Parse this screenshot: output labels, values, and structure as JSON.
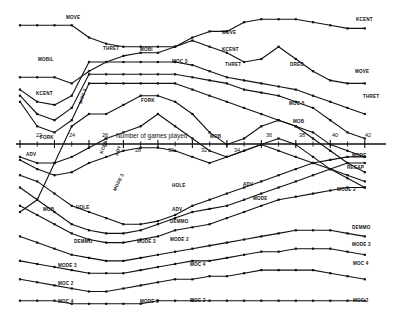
{
  "figure": {
    "kind": "scanned-multiline-chart",
    "background": "#ffffff",
    "ink": "#111111",
    "axis_title": "Number of games played"
  },
  "chart_data": {
    "type": "line",
    "title": "",
    "subtitle": "",
    "xlabel": "Number of games played",
    "ylabel": "",
    "grid": false,
    "legend": "inline-labels",
    "axis_position": "middle",
    "xlim": [
      21,
      43
    ],
    "ylim": [
      0,
      100
    ],
    "x_ticks": [
      22,
      24,
      26,
      28,
      30,
      32,
      34,
      36,
      38,
      40,
      42
    ],
    "x_tick_labels": [
      "22",
      "24",
      "26",
      "28",
      "30",
      "32",
      "34",
      "36",
      "38",
      "40",
      "42"
    ],
    "x_minor_ticks": [
      23,
      25,
      27,
      29,
      31,
      33,
      35,
      37,
      39,
      41
    ],
    "tick_label_alternating": true,
    "marker": "square",
    "series": [
      {
        "name": "MOVE",
        "label_left": "MOVE",
        "label_right": "KCENT",
        "x": [
          22,
          23,
          24,
          25,
          26,
          27,
          28,
          29,
          30,
          31,
          32,
          33,
          34,
          35,
          36,
          37,
          38,
          39,
          40,
          41,
          42
        ],
        "y": [
          95,
          95,
          95,
          95,
          91,
          89,
          88,
          88,
          88,
          88,
          91,
          93,
          93,
          96,
          97,
          97,
          97,
          96,
          95,
          94,
          94
        ]
      },
      {
        "name": "MOBIL",
        "label_left": "MOBIL",
        "label_right": "MOVE",
        "x": [
          22,
          23,
          24,
          25,
          26,
          27,
          28,
          29,
          30,
          31,
          32,
          33,
          34,
          35,
          36,
          37,
          38,
          39,
          40,
          41,
          42
        ],
        "y": [
          78,
          78,
          78,
          76,
          80,
          83,
          85,
          86,
          86,
          88,
          90,
          88,
          86,
          83,
          84,
          88,
          84,
          80,
          77,
          76,
          76
        ]
      },
      {
        "name": "KCENT",
        "label_left": "KCENT",
        "label_right": "THRET",
        "x": [
          22,
          23,
          24,
          25,
          26,
          27,
          28,
          29,
          30,
          31,
          32,
          33,
          34,
          35,
          36,
          37,
          38,
          39,
          40,
          41,
          42
        ],
        "y": [
          74,
          70,
          69,
          72,
          83,
          83,
          83,
          83,
          83,
          83,
          82,
          80,
          78,
          77,
          76,
          75,
          74,
          72,
          70,
          68,
          66
        ]
      },
      {
        "name": "THRET",
        "label_left": "",
        "label_right": "",
        "x": [
          22,
          23,
          24,
          25,
          26,
          27,
          28,
          29,
          30,
          31,
          32,
          33,
          34,
          35,
          36,
          37,
          38,
          39,
          40,
          41,
          42
        ],
        "y": [
          72,
          66,
          64,
          68,
          79,
          79,
          79,
          79,
          79,
          79,
          78,
          77,
          76,
          74,
          73,
          72,
          70,
          68,
          64,
          60,
          58
        ]
      },
      {
        "name": "MOBI",
        "label_left": "",
        "label_right": "",
        "x": [
          22,
          23,
          24,
          25,
          26,
          27,
          28,
          29,
          30,
          31,
          32,
          33,
          34,
          35,
          36,
          37,
          38,
          39,
          40,
          41,
          42
        ],
        "y": [
          70,
          62,
          60,
          64,
          76,
          76,
          76,
          76,
          76,
          76,
          74,
          72,
          70,
          68,
          66,
          64,
          62,
          60,
          56,
          54,
          52
        ]
      },
      {
        "name": "MOC 3",
        "label_left": "MOC 3",
        "label_right": "MOC 5",
        "x": [
          22,
          23,
          24,
          25,
          26,
          27,
          28,
          29,
          30,
          31,
          32,
          33,
          34,
          35,
          36,
          37,
          38,
          39,
          40,
          41,
          42
        ],
        "y": [
          34,
          38,
          50,
          62,
          66,
          66,
          69,
          72,
          72,
          70,
          66,
          60,
          56,
          58,
          62,
          64,
          62,
          58,
          54,
          50,
          47
        ]
      },
      {
        "name": "FORK",
        "label_left": "FORK",
        "label_right": "MOC 3",
        "x": [
          22,
          23,
          24,
          25,
          26,
          27,
          28,
          29,
          30,
          31,
          32,
          33,
          34,
          35,
          36,
          37,
          38,
          39,
          40,
          41,
          42
        ],
        "y": [
          52,
          50,
          50,
          52,
          55,
          58,
          60,
          62,
          66,
          62,
          58,
          54,
          52,
          54,
          56,
          54,
          52,
          50,
          48,
          46,
          44
        ]
      },
      {
        "name": "MOB",
        "label_left": "FORK",
        "label_right": "MOB",
        "x": [
          22,
          23,
          24,
          25,
          26,
          27,
          28,
          29,
          30,
          31,
          32,
          33,
          34,
          35,
          36,
          37,
          38,
          39,
          40,
          41,
          42
        ],
        "y": [
          51,
          48,
          46,
          47,
          50,
          52,
          54,
          55,
          55,
          54,
          52,
          50,
          52,
          54,
          56,
          58,
          56,
          52,
          48,
          45,
          42
        ]
      },
      {
        "name": "ADV",
        "label_left": "ADV",
        "label_right": "MODE",
        "x": [
          22,
          23,
          24,
          25,
          26,
          27,
          28,
          29,
          30,
          31,
          32,
          33,
          34,
          35,
          36,
          37,
          38,
          39,
          40,
          41,
          42
        ],
        "y": [
          46,
          44,
          40,
          36,
          34,
          32,
          30,
          30,
          31,
          33,
          36,
          38,
          40,
          42,
          44,
          46,
          48,
          50,
          51,
          52,
          52
        ]
      },
      {
        "name": "HOLE",
        "label_left": "HOLE",
        "label_right": "RECAP",
        "x": [
          22,
          23,
          24,
          25,
          26,
          27,
          28,
          29,
          30,
          31,
          32,
          33,
          34,
          35,
          36,
          37,
          38,
          39,
          40,
          41,
          42
        ],
        "y": [
          42,
          38,
          34,
          30,
          28,
          27,
          27,
          28,
          30,
          32,
          34,
          35,
          36,
          38,
          40,
          42,
          44,
          46,
          48,
          50,
          50
        ]
      },
      {
        "name": "DEMMO",
        "label_left": "DEMMO",
        "label_right": "MODE 2",
        "x": [
          22,
          23,
          24,
          25,
          26,
          27,
          28,
          29,
          30,
          31,
          32,
          33,
          34,
          35,
          36,
          37,
          38,
          39,
          40,
          41,
          42
        ],
        "y": [
          36,
          33,
          30,
          27,
          25,
          24,
          24,
          25,
          26,
          28,
          29,
          30,
          32,
          34,
          36,
          38,
          39,
          40,
          41,
          42,
          42
        ]
      },
      {
        "name": "MODE 3",
        "label_left": "MODE 3",
        "label_right": "DEMMO",
        "x": [
          22,
          23,
          24,
          25,
          26,
          27,
          28,
          29,
          30,
          31,
          32,
          33,
          34,
          35,
          36,
          37,
          38,
          39,
          40,
          41,
          42
        ],
        "y": [
          26,
          24,
          22,
          20,
          19,
          18,
          18,
          19,
          20,
          21,
          22,
          23,
          24,
          25,
          26,
          27,
          28,
          28,
          28,
          27,
          26
        ]
      },
      {
        "name": "MOC 2",
        "label_left": "MOC 2",
        "label_right": "MODE 3",
        "x": [
          22,
          23,
          24,
          25,
          26,
          27,
          28,
          29,
          30,
          31,
          32,
          33,
          34,
          35,
          36,
          37,
          38,
          39,
          40,
          41,
          42
        ],
        "y": [
          18,
          17,
          16,
          15,
          14,
          14,
          14,
          15,
          16,
          17,
          18,
          18,
          19,
          20,
          21,
          21,
          22,
          22,
          22,
          21,
          20
        ]
      },
      {
        "name": "MOC 4",
        "label_left": "MOC 4",
        "label_right": "MOC 4",
        "x": [
          22,
          23,
          24,
          25,
          26,
          27,
          28,
          29,
          30,
          31,
          32,
          33,
          34,
          35,
          36,
          37,
          38,
          39,
          40,
          41,
          42
        ],
        "y": [
          12,
          11,
          10,
          9,
          8,
          8,
          9,
          10,
          11,
          12,
          12,
          13,
          13,
          14,
          15,
          15,
          15,
          15,
          14,
          13,
          12
        ]
      },
      {
        "name": "MODE 5",
        "label_left": "MODE 5",
        "label_right": "MOC 2",
        "x": [
          22,
          23,
          24,
          25,
          26,
          27,
          28,
          29,
          30,
          31,
          32,
          33,
          34,
          35,
          36,
          37,
          38,
          39,
          40,
          41,
          42
        ],
        "y": [
          5,
          5,
          5,
          4,
          4,
          4,
          4,
          4,
          5,
          5,
          5,
          5,
          5,
          5,
          5,
          5,
          5,
          5,
          5,
          5,
          5
        ]
      }
    ]
  },
  "labels": [
    {
      "id": "move-top-left",
      "text": "MOVE",
      "x": 66,
      "y": 16,
      "rot": 0
    },
    {
      "id": "mobil-left",
      "text": "MOBIL",
      "x": 38,
      "y": 58,
      "rot": 0
    },
    {
      "id": "kcent-left",
      "text": "KCENT",
      "x": 36,
      "y": 92,
      "rot": 0
    },
    {
      "id": "thret-mid-upper",
      "text": "THRET",
      "x": 103,
      "y": 47,
      "rot": 0
    },
    {
      "id": "mobi-mid-upper",
      "text": "MOBI",
      "x": 140,
      "y": 48,
      "rot": 0
    },
    {
      "id": "moc3-mid-upper",
      "text": "MOC 3",
      "x": 172,
      "y": 60,
      "rot": 0
    },
    {
      "id": "move-mid-upper",
      "text": "MOVE",
      "x": 222,
      "y": 31,
      "rot": 0
    },
    {
      "id": "kcent-mid-upper",
      "text": "KCENT",
      "x": 222,
      "y": 48,
      "rot": 0
    },
    {
      "id": "thret-mid-right",
      "text": "THRET",
      "x": 225,
      "y": 63,
      "rot": 0
    },
    {
      "id": "dreo",
      "text": "DREO",
      "x": 290,
      "y": 63,
      "rot": 0
    },
    {
      "id": "kcent-right",
      "text": "KCENT",
      "x": 356,
      "y": 18,
      "rot": 0
    },
    {
      "id": "move-right",
      "text": "MOVE",
      "x": 355,
      "y": 70,
      "rot": 0
    },
    {
      "id": "thret-right",
      "text": "THRET",
      "x": 363,
      "y": 95,
      "rot": 0
    },
    {
      "id": "moc5-right",
      "text": "MOC 5",
      "x": 289,
      "y": 102,
      "rot": 0
    },
    {
      "id": "mob-right-upper",
      "text": "MOB",
      "x": 293,
      "y": 120,
      "rot": 0
    },
    {
      "id": "fork-mid",
      "text": "FORK",
      "x": 141,
      "y": 99,
      "rot": 0
    },
    {
      "id": "fork-axis",
      "text": "FORK",
      "x": 40,
      "y": 136,
      "rot": 0
    },
    {
      "id": "mob-axis",
      "text": "MOB",
      "x": 210,
      "y": 135,
      "rot": 0
    },
    {
      "id": "moc3-rot",
      "text": "MOC 3",
      "x": 79,
      "y": 103,
      "rot": -72
    },
    {
      "id": "kcent-rot",
      "text": "KCENT",
      "x": 100,
      "y": 153,
      "rot": -72
    },
    {
      "id": "adv-rot",
      "text": "ADV",
      "x": 115,
      "y": 155,
      "rot": -72
    },
    {
      "id": "mode3-rot",
      "text": "MODE 3",
      "x": 113,
      "y": 190,
      "rot": -64
    },
    {
      "id": "adv-left",
      "text": "ADV",
      "x": 26,
      "y": 153,
      "rot": 0
    },
    {
      "id": "mob-left",
      "text": "MOB",
      "x": 43,
      "y": 208,
      "rot": 0
    },
    {
      "id": "hole-left",
      "text": "HOLE",
      "x": 76,
      "y": 206,
      "rot": 0
    },
    {
      "id": "demmo-left",
      "text": "DEMMO",
      "x": 74,
      "y": 240,
      "rot": 0
    },
    {
      "id": "mode3-left",
      "text": "MODE 3",
      "x": 58,
      "y": 264,
      "rot": 0
    },
    {
      "id": "moc2-left",
      "text": "MOC 2",
      "x": 58,
      "y": 282,
      "rot": 0
    },
    {
      "id": "moc4-left",
      "text": "MOC 4",
      "x": 58,
      "y": 300,
      "rot": 0
    },
    {
      "id": "hole-mid",
      "text": "HOLE",
      "x": 172,
      "y": 184,
      "rot": 0
    },
    {
      "id": "adv-mid",
      "text": "ADV",
      "x": 172,
      "y": 208,
      "rot": 0
    },
    {
      "id": "demmo-mid",
      "text": "DEMMO",
      "x": 170,
      "y": 220,
      "rot": 0
    },
    {
      "id": "mode3-mid",
      "text": "MODE 3",
      "x": 137,
      "y": 240,
      "rot": 0
    },
    {
      "id": "mode2-mid",
      "text": "MODE 2",
      "x": 170,
      "y": 238,
      "rot": 0
    },
    {
      "id": "moc4-mid",
      "text": "MOC 4",
      "x": 190,
      "y": 263,
      "rot": 0
    },
    {
      "id": "mode5-mid",
      "text": "MODE 5",
      "x": 140,
      "y": 300,
      "rot": 0
    },
    {
      "id": "moc2-mid-lower",
      "text": "MOC 2",
      "x": 190,
      "y": 299,
      "rot": 0
    },
    {
      "id": "adv-right-mid",
      "text": "ADV",
      "x": 243,
      "y": 183,
      "rot": 0
    },
    {
      "id": "mode-right-mid",
      "text": "MODE",
      "x": 253,
      "y": 197,
      "rot": 0
    },
    {
      "id": "mode-right",
      "text": "MODE",
      "x": 352,
      "y": 154,
      "rot": 0
    },
    {
      "id": "recap-right",
      "text": "RECAP",
      "x": 347,
      "y": 166,
      "rot": 0
    },
    {
      "id": "mode2-right",
      "text": "MODE 2",
      "x": 337,
      "y": 188,
      "rot": 0
    },
    {
      "id": "demmo-right",
      "text": "DEMMO",
      "x": 352,
      "y": 226,
      "rot": 0
    },
    {
      "id": "mode3-right",
      "text": "MODE 3",
      "x": 352,
      "y": 243,
      "rot": 0
    },
    {
      "id": "moc4-right",
      "text": "MOC 4",
      "x": 353,
      "y": 262,
      "rot": 0
    },
    {
      "id": "moc2-right",
      "text": "MOC 2",
      "x": 353,
      "y": 299,
      "rot": 0
    }
  ],
  "axis": {
    "title": "Number of games played",
    "title_x": 116,
    "title_y": 133,
    "ticks_above": [
      {
        "v": "22",
        "x": 36
      },
      {
        "v": "24",
        "x": 69
      },
      {
        "v": "26",
        "x": 102
      },
      {
        "v": "36",
        "x": 266
      },
      {
        "v": "38",
        "x": 299
      },
      {
        "v": "40",
        "x": 332
      },
      {
        "v": "42",
        "x": 365
      }
    ],
    "ticks_below": [
      {
        "v": "28",
        "x": 135
      },
      {
        "v": "30",
        "x": 168
      },
      {
        "v": "32",
        "x": 201
      },
      {
        "v": "34",
        "x": 234
      }
    ]
  }
}
